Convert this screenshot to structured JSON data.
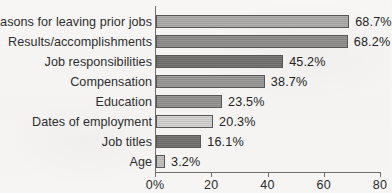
{
  "chart_data": {
    "type": "bar",
    "orientation": "horizontal",
    "title": "",
    "xlabel": "",
    "ylabel": "",
    "xlim": [
      0,
      80
    ],
    "grid": false,
    "legend": "none",
    "x_tick_labels": [
      "0%",
      "20",
      "40",
      "60",
      "80"
    ],
    "x_ticks": [
      0,
      20,
      40,
      60,
      80
    ],
    "categories": [
      "Reasons for leaving prior jobs",
      "Results/accomplishments",
      "Job responsibilities",
      "Compensation",
      "Education",
      "Dates of employment",
      "Job titles",
      "Age"
    ],
    "values": [
      68.7,
      68.2,
      45.2,
      38.7,
      23.5,
      20.3,
      16.1,
      3.2
    ],
    "value_labels": [
      "68.7%",
      "68.2%",
      "45.2%",
      "38.7%",
      "23.5%",
      "20.3%",
      "16.1%",
      "3.2%"
    ],
    "bar_colors": [
      "#a9a8a6",
      "#8a8987",
      "#6d6c6a",
      "#949391",
      "#8f8e8c",
      "#cfcecc",
      "#6d6c6a",
      "#bfbebc"
    ],
    "bar_border_color": "#575654",
    "axis_color": "#6f6e6c",
    "background_color": "#f6f5f3",
    "text_color": "#2b2b2b"
  },
  "artifacts": {
    "top_crop_mark": "·"
  }
}
